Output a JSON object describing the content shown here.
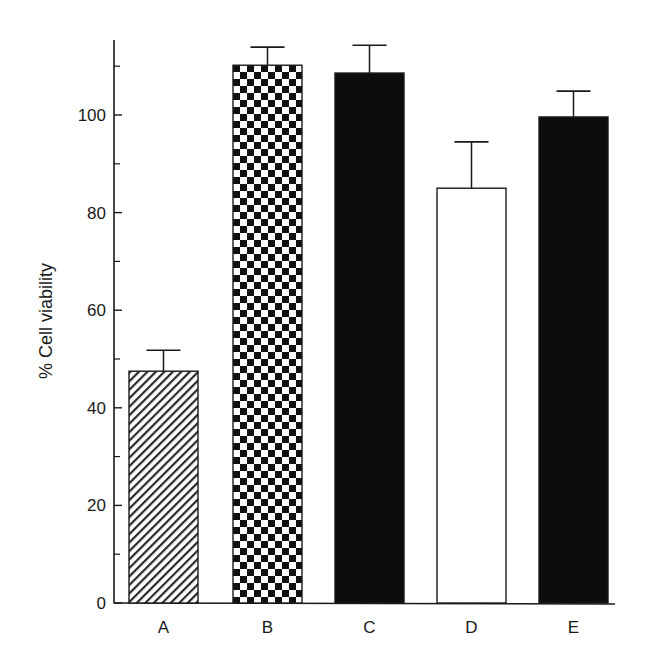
{
  "chart_data": {
    "type": "bar",
    "title": "",
    "xlabel": "",
    "ylabel": "% Cell viability",
    "categories": [
      "A",
      "B",
      "C",
      "D",
      "E"
    ],
    "values": [
      47.5,
      110.2,
      108.6,
      85.0,
      99.6
    ],
    "error_upper": [
      51.8,
      113.9,
      114.3,
      94.5,
      104.9
    ],
    "fills": [
      "hatch",
      "checker",
      "solid-black",
      "white",
      "solid-black"
    ],
    "ylim": [
      0,
      118
    ],
    "yticks_major": [
      0,
      20,
      40,
      60,
      80,
      100
    ],
    "yticks_minor": [
      10,
      30,
      50,
      70,
      90,
      110
    ],
    "grid": false,
    "legend": null
  },
  "axis": {
    "ylabel": "% Cell viability",
    "ytick_labels": [
      "0",
      "20",
      "40",
      "60",
      "80",
      "100"
    ],
    "xtick_labels": [
      "A",
      "B",
      "C",
      "D",
      "E"
    ]
  },
  "colors": {
    "ink": "#1a1a1a",
    "background": "#ffffff"
  }
}
